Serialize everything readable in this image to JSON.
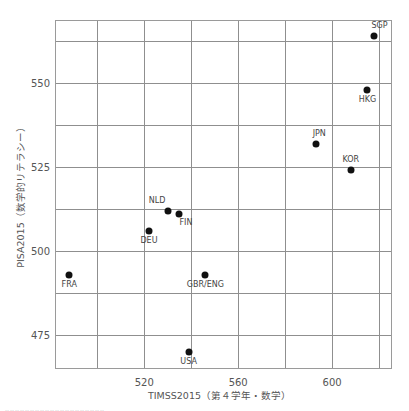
{
  "chart_data": {
    "type": "scatter",
    "title": "",
    "xlabel": "TIMSS2015（第４学年・数学）",
    "ylabel": "PISA2015（数学的リテラシー）",
    "xlim": [
      482,
      625.5
    ],
    "ylim": [
      465,
      568.7
    ],
    "x_ticks": [
      520,
      560,
      600
    ],
    "y_ticks": [
      475,
      500,
      525,
      550
    ],
    "x_gridlines": [
      500,
      520,
      540,
      560,
      580,
      600,
      620
    ],
    "y_gridlines": [
      475,
      487.5,
      500,
      512.5,
      525,
      537.5,
      550,
      562.5
    ],
    "grid": true,
    "legend": null,
    "points": [
      {
        "label": "SGP",
        "x": 618,
        "y": 564,
        "label_pos": "above-right"
      },
      {
        "label": "HKG",
        "x": 615,
        "y": 548,
        "label_pos": "below"
      },
      {
        "label": "JPN",
        "x": 593,
        "y": 532,
        "label_pos": "above-right"
      },
      {
        "label": "KOR",
        "x": 608,
        "y": 524,
        "label_pos": "above"
      },
      {
        "label": "NLD",
        "x": 530,
        "y": 512,
        "label_pos": "above-left"
      },
      {
        "label": "FIN",
        "x": 535,
        "y": 511,
        "label_pos": "below-right"
      },
      {
        "label": "DEU",
        "x": 522,
        "y": 506,
        "label_pos": "below"
      },
      {
        "label": "FRA",
        "x": 488,
        "y": 493,
        "label_pos": "below"
      },
      {
        "label": "GBR/ENG",
        "x": 546,
        "y": 493,
        "label_pos": "below"
      },
      {
        "label": "USA",
        "x": 539,
        "y": 470,
        "label_pos": "below"
      }
    ]
  },
  "layout": {
    "plot_left": 55,
    "plot_top": 20,
    "plot_width": 337,
    "plot_height": 349
  },
  "footer_cut_text": "‥‥‥‥‥‥‥‥‥‥‥‥‥‥‥‥‥‥‥‥"
}
